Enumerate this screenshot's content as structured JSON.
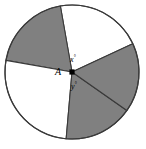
{
  "figure": {
    "name": "circle-with-five-sectors",
    "background_color": "#ffffff",
    "shaded_color": "#808080",
    "unshaded_color": "#ffffff",
    "outline_color": "#3a3a3a",
    "center_dot_color": "#000000"
  },
  "circle": {
    "center_x": 72,
    "center_y": 72,
    "radius": 67
  },
  "labels": {
    "vertex": "A",
    "angle_x": "x",
    "angle_x_degree": "°",
    "angle_y": "y",
    "angle_y_degree": "°"
  },
  "chart_data": {
    "type": "pie",
    "categories": [
      "sector-top-white",
      "sector-upper-right-shaded",
      "sector-lower-right-white",
      "sector-bottom-shaded",
      "sector-upper-left-shaded"
    ],
    "values": [
      75,
      55,
      60,
      95,
      75
    ],
    "labels": [
      "",
      "",
      "",
      "",
      ""
    ],
    "colors": [
      "#ffffff",
      "#808080",
      "#ffffff",
      "#808080",
      "#808080"
    ],
    "boundary_angles_deg": [
      25,
      100,
      170,
      265,
      325
    ],
    "legend": "none",
    "grid": false,
    "annotations": [
      {
        "text": "A",
        "role": "center-vertex-label"
      },
      {
        "text": "x°",
        "role": "angle-above-center"
      },
      {
        "text": "y°",
        "role": "angle-below-center"
      }
    ]
  }
}
